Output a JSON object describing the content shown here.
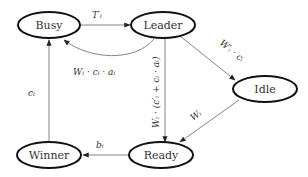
{
  "diagram": {
    "type": "state-transition",
    "nodes": [
      {
        "id": "busy",
        "label": "Busy"
      },
      {
        "id": "leader",
        "label": "Leader"
      },
      {
        "id": "idle",
        "label": "Idle"
      },
      {
        "id": "ready",
        "label": "Ready"
      },
      {
        "id": "winner",
        "label": "Winner"
      }
    ],
    "edges": [
      {
        "from": "busy",
        "to": "leader",
        "label": "T′ᵢ"
      },
      {
        "from": "leader",
        "to": "busy",
        "label": "Wᵢ · cᵢ · aᵢ"
      },
      {
        "from": "leader",
        "to": "idle",
        "label": "W′ᵢ · cᵢ"
      },
      {
        "from": "leader",
        "to": "ready",
        "label": "Wᵢ · (c′ᵢ + cᵢ · aᵢ)"
      },
      {
        "from": "idle",
        "to": "ready",
        "label": "Wᵢ"
      },
      {
        "from": "ready",
        "to": "winner",
        "label": "bᵢ"
      },
      {
        "from": "winner",
        "to": "busy",
        "label": "cᵢ"
      }
    ]
  }
}
